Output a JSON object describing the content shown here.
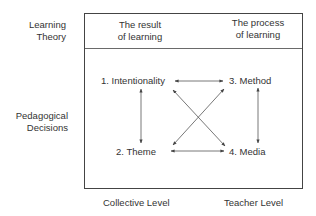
{
  "row_labels": {
    "learning_theory": [
      "Learning",
      "Theory"
    ],
    "pedagogical_decisions": [
      "Pedagogical",
      "Decisions"
    ]
  },
  "column_headers": {
    "left": [
      "The result",
      "of learning"
    ],
    "right": [
      "The process",
      "of learning"
    ]
  },
  "nodes": {
    "n1": "1. Intentionality",
    "n2": "2. Theme",
    "n3": "3. Method",
    "n4": "4. Media"
  },
  "column_footers": {
    "left": "Collective Level",
    "right": "Teacher Level"
  },
  "edges": [
    {
      "from": "1. Intentionality",
      "to": "3. Method",
      "type": "bidirectional"
    },
    {
      "from": "1. Intentionality",
      "to": "2. Theme",
      "type": "bidirectional"
    },
    {
      "from": "3. Method",
      "to": "4. Media",
      "type": "bidirectional"
    },
    {
      "from": "2. Theme",
      "to": "4. Media",
      "type": "bidirectional"
    },
    {
      "from": "1. Intentionality",
      "to": "4. Media",
      "type": "bidirectional"
    },
    {
      "from": "2. Theme",
      "to": "3. Method",
      "type": "bidirectional"
    }
  ],
  "colors": {
    "line": "#444444",
    "text": "#333333",
    "background": "#ffffff"
  }
}
